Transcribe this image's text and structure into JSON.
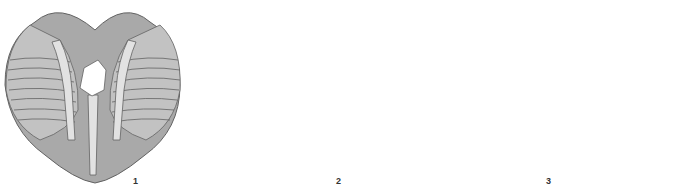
{
  "figure": {
    "type": "anatomical-illustration",
    "colors": {
      "body": "#a9a9a9",
      "mantle": "#c2c2c2",
      "gill_bar": "#e2e2e2",
      "outline": "#626262",
      "background": "#ffffff"
    },
    "panels": [
      {
        "id": "1",
        "label": "1",
        "description": "Open body, ventral view, central hole"
      },
      {
        "id": "2",
        "label": "2",
        "description": "Body with detached foot/strand removed"
      },
      {
        "id": "3",
        "label": "3",
        "description": "Body split into two halves"
      },
      {
        "id": "4",
        "label": "",
        "description": "Half with knife inserted"
      }
    ]
  }
}
